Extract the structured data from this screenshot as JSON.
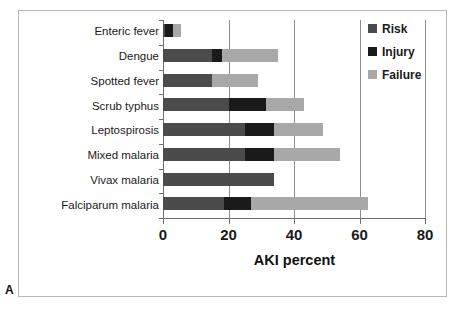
{
  "panel": {
    "letter": "A"
  },
  "chart_data": {
    "type": "bar",
    "orientation": "horizontal",
    "stacked": true,
    "title": "",
    "xlabel": "AKI percent",
    "ylabel": "",
    "xlim": [
      0,
      80
    ],
    "xticks": [
      0,
      20,
      40,
      60,
      80
    ],
    "xtick_labels": [
      "0",
      "20",
      "40",
      "60",
      "80"
    ],
    "grid": "vertical",
    "legend_position": "top-right",
    "categories": [
      "Enteric fever",
      "Dengue",
      "Spotted fever",
      "Scrub typhus",
      "Leptospirosis",
      "Mixed malaria",
      "Vivax malaria",
      "Falciparum malaria"
    ],
    "series": [
      {
        "name": "Risk",
        "color": "#4b4b4b",
        "values": [
          0.5,
          15,
          15,
          20,
          25,
          25,
          34,
          18.5
        ]
      },
      {
        "name": "Injury",
        "color": "#1a1a1a",
        "values": [
          2.5,
          3,
          0,
          11.5,
          9,
          9,
          0,
          8.5
        ]
      },
      {
        "name": "Failure",
        "color": "#a8a8a8",
        "values": [
          2.5,
          17,
          14,
          11.5,
          15,
          20,
          0,
          35.5
        ]
      }
    ],
    "totals": [
      5.5,
      35,
      29,
      43,
      49,
      54,
      34,
      62.5
    ]
  }
}
